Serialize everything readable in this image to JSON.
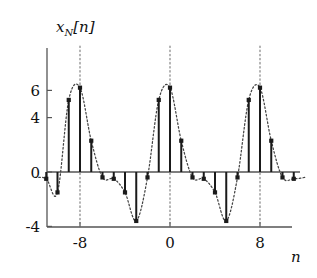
{
  "chart_data": {
    "type": "scatter",
    "plot_style": "stem",
    "title": "",
    "xlabel": "n",
    "ylabel": "x_N[n]",
    "ylabel_base": "x",
    "ylabel_subscript": "N",
    "ylabel_bracket": "[n]",
    "xlim": [
      -12.6,
      12.6
    ],
    "ylim": [
      -4.2,
      7.4
    ],
    "xticks": [
      -8,
      0,
      8
    ],
    "xticklabels": [
      "-8",
      "0",
      "8"
    ],
    "yticks": [
      6,
      4,
      0,
      -4
    ],
    "yticklabels": [
      "6",
      "4",
      "0",
      "-4"
    ],
    "grid": false,
    "gridlines_vertical_dotted_at": [
      -8,
      0,
      8
    ],
    "envelope": "dotted interpolating curve through stem tips",
    "period": 8,
    "legend": null,
    "x": [
      -12,
      -11,
      -10,
      -9,
      -8,
      -7,
      -6,
      -5,
      -4,
      -3,
      -2,
      -1,
      0,
      1,
      2,
      3,
      4,
      5,
      6,
      7,
      8,
      9,
      10,
      11,
      12
    ],
    "values": [
      -0.4,
      -0.5,
      -1.5,
      -3.6,
      6.2,
      5.3,
      2.3,
      -0.4,
      -0.5,
      -1.5,
      -3.6,
      5.3,
      6.2,
      2.3,
      -0.4,
      -0.5,
      -1.5,
      -3.6,
      -0.4,
      5.3,
      6.2,
      2.3,
      -0.4,
      -0.5,
      -0.4
    ],
    "stems": [
      {
        "n": -12,
        "y": -0.4
      },
      {
        "n": -11,
        "y": -0.5
      },
      {
        "n": -10,
        "y": -1.5
      },
      {
        "n": -9,
        "y": 5.3
      },
      {
        "n": -8,
        "y": 6.2
      },
      {
        "n": -7,
        "y": 2.3
      },
      {
        "n": -6,
        "y": -0.4
      },
      {
        "n": -5,
        "y": -0.5
      },
      {
        "n": -4,
        "y": -1.5
      },
      {
        "n": -3,
        "y": -3.6
      },
      {
        "n": -2,
        "y": -0.4
      },
      {
        "n": -1,
        "y": 5.3
      },
      {
        "n": 0,
        "y": 6.2
      },
      {
        "n": 1,
        "y": 2.3
      },
      {
        "n": 2,
        "y": -0.4
      },
      {
        "n": 3,
        "y": -0.5
      },
      {
        "n": 4,
        "y": -1.5
      },
      {
        "n": 5,
        "y": -3.6
      },
      {
        "n": 6,
        "y": -0.4
      },
      {
        "n": 7,
        "y": 5.3
      },
      {
        "n": 8,
        "y": 6.2
      },
      {
        "n": 9,
        "y": 2.3
      },
      {
        "n": 10,
        "y": -0.4
      },
      {
        "n": 11,
        "y": -0.5
      },
      {
        "n": 12,
        "y": -0.4
      }
    ],
    "colors": {
      "stem": "#1a1a1a",
      "marker": "#1a1a1a",
      "axis": "#555555",
      "envelope": "#444444",
      "gridline": "#777777",
      "background": "#ffffff"
    }
  }
}
